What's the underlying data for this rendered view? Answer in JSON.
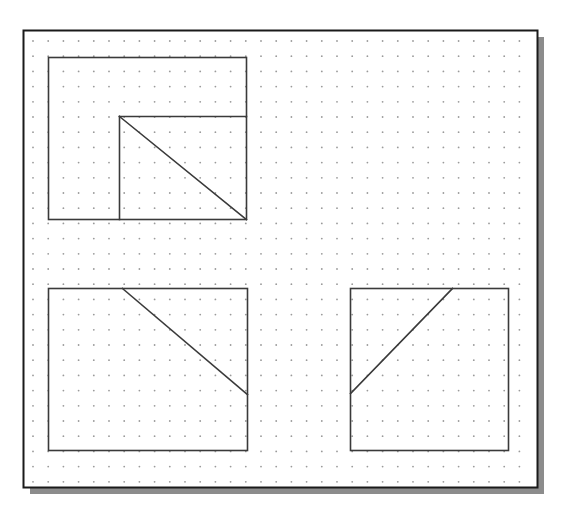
{
  "canvas": {
    "name": "dot-grid-drawing-canvas",
    "width": 569,
    "height": 516,
    "background_color": "#ffffff",
    "frame": {
      "x": 23,
      "y": 30,
      "width": 514,
      "height": 457,
      "fill": "#ffffff",
      "border_color": "#1a1a1a",
      "border_width": 2
    },
    "shadow": {
      "color": "#8c8c8c",
      "offset_x": 7,
      "offset_y": 7
    },
    "grid": {
      "spacing": 15.2,
      "origin_x": 33,
      "origin_y": 41,
      "dot_color": "#9a9a9a",
      "dot_radius": 0.9,
      "columns": 33,
      "rows": 30
    },
    "stroke_color": "#3a3a3a",
    "stroke_width": 1.6
  },
  "chart_data": {
    "type": "diagram",
    "title": "",
    "grid_spacing_px": 15.2,
    "shapes": [
      {
        "id": "shape-1",
        "label": "top-left-rectangle-with-inner-square-and-diagonal",
        "outer_rect": {
          "x1": 48,
          "y1": 57,
          "x2": 246,
          "y2": 219
        },
        "inner_corner": {
          "x": 119,
          "y": 116
        },
        "segments": [
          {
            "name": "horizontal-divider",
            "x1": 119,
            "y1": 116,
            "x2": 246,
            "y2": 116
          },
          {
            "name": "vertical-divider",
            "x1": 119,
            "y1": 116,
            "x2": 119,
            "y2": 219
          },
          {
            "name": "diagonal",
            "x1": 119,
            "y1": 116,
            "x2": 246,
            "y2": 219
          }
        ]
      },
      {
        "id": "shape-2",
        "label": "bottom-left-rectangle-with-descending-diagonal",
        "outer_rect": {
          "x1": 48,
          "y1": 288,
          "x2": 247,
          "y2": 450
        },
        "segments": [
          {
            "name": "diagonal",
            "x1": 122,
            "y1": 288,
            "x2": 247,
            "y2": 394
          }
        ]
      },
      {
        "id": "shape-3",
        "label": "bottom-right-rectangle-with-ascending-diagonal",
        "outer_rect": {
          "x1": 350,
          "y1": 288,
          "x2": 508,
          "y2": 450
        },
        "segments": [
          {
            "name": "diagonal",
            "x1": 350,
            "y1": 393,
            "x2": 452,
            "y2": 288
          }
        ]
      }
    ]
  }
}
